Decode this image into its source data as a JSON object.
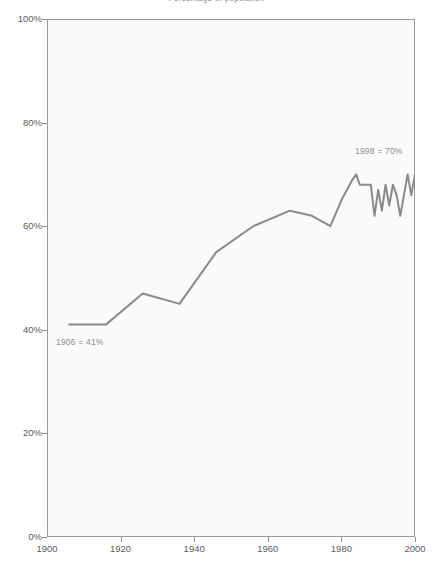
{
  "chart_data": {
    "type": "line",
    "title": "Percentage of population",
    "xlabel": "",
    "ylabel": "",
    "xlim": [
      1900,
      2000
    ],
    "ylim": [
      0,
      100
    ],
    "grid": false,
    "legend": null,
    "x_ticks": [
      1900,
      1920,
      1940,
      1960,
      1980,
      2000
    ],
    "x_tick_labels": [
      "1900",
      "1920",
      "1940",
      "1960",
      "1980",
      "2000"
    ],
    "y_ticks": [
      0,
      20,
      40,
      60,
      80,
      100
    ],
    "y_tick_labels": [
      "0%",
      "20%",
      "40%",
      "60%",
      "80%",
      "100%"
    ],
    "line_color": "#8a8a8a",
    "plot_background": "#fafafa",
    "frame_color": "#9a9a9a",
    "series": [
      {
        "name": "Percentage",
        "x": [
          1906,
          1916,
          1926,
          1936,
          1946,
          1956,
          1966,
          1972,
          1977,
          1980,
          1983,
          1984,
          1985,
          1986,
          1987,
          1988,
          1989,
          1990,
          1991,
          1992,
          1993,
          1994,
          1995,
          1996,
          1997,
          1998,
          1999,
          2000
        ],
        "values": [
          41,
          41,
          47,
          45,
          55,
          60,
          63,
          62,
          60,
          65,
          69,
          70,
          68,
          68,
          68,
          68,
          62,
          67,
          63,
          68,
          64,
          68,
          66,
          62,
          66,
          70,
          66,
          70
        ]
      }
    ],
    "annotations": [
      {
        "id": "start",
        "text": "1906 = 41%",
        "x": 1906,
        "y": 41
      },
      {
        "id": "end",
        "text": "1998 = 70%",
        "x": 1998,
        "y": 70
      }
    ]
  }
}
